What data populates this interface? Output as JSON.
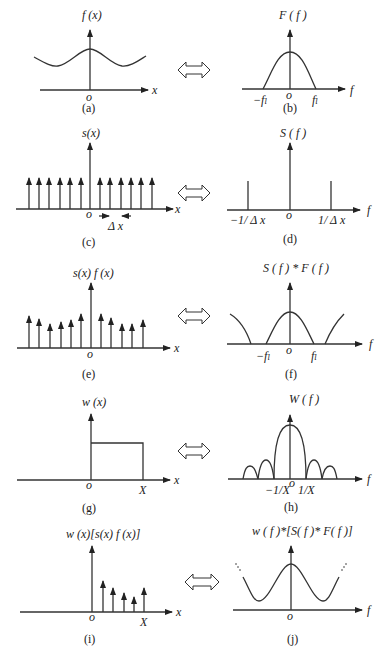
{
  "panels": {
    "a": {
      "caption": "(a)",
      "ylabel": "f (x)",
      "xlabel": "x",
      "origin": "o"
    },
    "b": {
      "caption": "(b)",
      "ylabel": "F ( f )",
      "xlabel": "f",
      "origin": "o",
      "ticks": [
        "−fₗ",
        "fₗ"
      ]
    },
    "c": {
      "caption": "(c)",
      "ylabel": "s(x)",
      "xlabel": "x",
      "origin": "o",
      "spacing": "Δ x"
    },
    "d": {
      "caption": "(d)",
      "ylabel": "S ( f )",
      "xlabel": "f",
      "origin": "o",
      "ticks": [
        "−1/ Δ x",
        "1/ Δ x"
      ]
    },
    "e": {
      "caption": "(e)",
      "ylabel": "s(x) f (x)",
      "xlabel": "x",
      "origin": "o"
    },
    "f": {
      "caption": "(f)",
      "ylabel": "S ( f ) * F ( f )",
      "xlabel": "f",
      "origin": "o",
      "ticks": [
        "−fₗ",
        "fₗ"
      ]
    },
    "g": {
      "caption": "(g)",
      "ylabel": "w (x)",
      "xlabel": "x",
      "origin": "o",
      "xtick": "X"
    },
    "h": {
      "caption": "(h)",
      "ylabel": "W ( f )",
      "xlabel": "f",
      "origin": "o",
      "ticks": [
        "−1/X",
        "1/X"
      ]
    },
    "i": {
      "caption": "(i)",
      "ylabel": "w (x)[s(x) f (x)]",
      "xlabel": "x",
      "origin": "o",
      "xtick": "X"
    },
    "j": {
      "caption": "(j)",
      "ylabel": "w ( f )*[S( f )* F( f )]",
      "xlabel": "f",
      "origin": "o"
    }
  },
  "arrow_symbol": "double-headed transform arrow"
}
